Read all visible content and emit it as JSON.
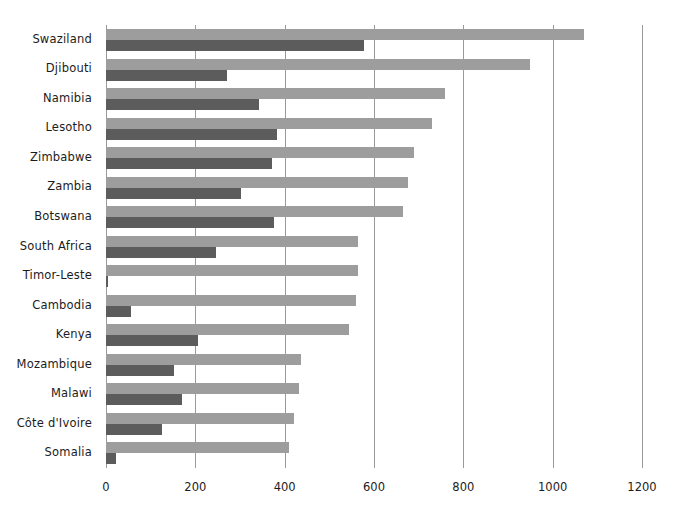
{
  "chart_data": {
    "type": "bar",
    "orientation": "horizontal",
    "title": "",
    "subtitle": "",
    "xlabel": "",
    "ylabel": "",
    "xlim": [
      0,
      1200
    ],
    "xticks": [
      0,
      200,
      400,
      600,
      800,
      1000,
      1200
    ],
    "xtick_labels": [
      "0",
      "200",
      "400",
      "600",
      "800",
      "1000",
      "1200"
    ],
    "grid": "vertical",
    "legend": "none",
    "categories": [
      "Swaziland",
      "Djibouti",
      "Namibia",
      "Lesotho",
      "Zimbabwe",
      "Zambia",
      "Botswana",
      "South Africa",
      "Timor-Leste",
      "Cambodia",
      "Kenya",
      "Mozambique",
      "Malawi",
      "Côte d'Ivoire",
      "Somalia"
    ],
    "series": [
      {
        "name": "light-series",
        "color": "#9d9d9d",
        "values": [
          1070,
          950,
          760,
          730,
          690,
          675,
          665,
          565,
          565,
          560,
          545,
          437,
          432,
          420,
          410
        ]
      },
      {
        "name": "dark-series",
        "color": "#5c5c5c",
        "values": [
          578,
          270,
          343,
          383,
          372,
          302,
          377,
          247,
          4,
          57,
          205,
          152,
          170,
          126,
          22
        ]
      }
    ]
  },
  "colors": {
    "light_bar": "#9d9d9d",
    "dark_bar": "#5c5c5c",
    "gridline": "#9a9a9a",
    "text": "#1c1c1c",
    "background": "#ffffff"
  }
}
